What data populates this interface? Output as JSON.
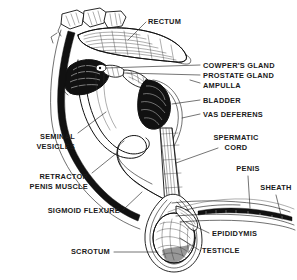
{
  "figure": {
    "background_color": "#ffffff",
    "ink_color": "#111111",
    "label_color": "#1a1a1a",
    "width": 297,
    "height": 280
  },
  "labels": {
    "rectum": "RECTUM",
    "cowpers_gland": "COWPER'S GLAND",
    "prostate_gland": "PROSTATE GLAND",
    "ampulla": "AMPULLA",
    "bladder": "BLADDER",
    "vas_deferens": "VAS DEFERENS",
    "spermatic_cord_line1": "SPERMATIC",
    "spermatic_cord_line2": "CORD",
    "penis": "PENIS",
    "sheath": "SHEATH",
    "seminal_vesicles_line1": "SEMINAL",
    "seminal_vesicles_line2": "VESICLES",
    "retractor_penis_muscle_line1": "RETRACTOR",
    "retractor_penis_muscle_line2": "PENIS MUSCLE",
    "sigmoid_flexure": "SIGMOID FLEXURE",
    "scrotum": "SCROTUM",
    "epididymis": "EPIDIDYMIS",
    "testicle": "TESTICLE"
  },
  "label_list": [
    {
      "id": "rectum",
      "text": "RECTUM",
      "side": "right",
      "x": 148,
      "y": 24
    },
    {
      "id": "cowpers-gland",
      "text": "COWPER'S GLAND",
      "side": "right",
      "x": 203,
      "y": 68
    },
    {
      "id": "prostate-gland",
      "text": "PROSTATE GLAND",
      "side": "right",
      "x": 203,
      "y": 78
    },
    {
      "id": "ampulla",
      "text": "AMPULLA",
      "side": "right",
      "x": 203,
      "y": 88
    },
    {
      "id": "bladder",
      "text": "BLADDER",
      "side": "right",
      "x": 203,
      "y": 103
    },
    {
      "id": "vas-deferens",
      "text": "VAS DEFERENS",
      "side": "right",
      "x": 203,
      "y": 117
    },
    {
      "id": "spermatic-cord",
      "text": "SPERMATIC CORD",
      "side": "right",
      "x": 236,
      "y": 140
    },
    {
      "id": "penis",
      "text": "PENIS",
      "side": "right",
      "x": 246,
      "y": 171
    },
    {
      "id": "sheath",
      "text": "SHEATH",
      "side": "right",
      "x": 271,
      "y": 190
    },
    {
      "id": "seminal-vesicles",
      "text": "SEMINAL VESICLES",
      "side": "left",
      "x": 75,
      "y": 139
    },
    {
      "id": "retractor-penis-muscle",
      "text": "RETRACTOR PENIS MUSCLE",
      "side": "left",
      "x": 88,
      "y": 179
    },
    {
      "id": "sigmoid-flexure",
      "text": "SIGMOID FLEXURE",
      "side": "left",
      "x": 120,
      "y": 213
    },
    {
      "id": "scrotum",
      "text": "SCROTUM",
      "side": "left",
      "x": 110,
      "y": 254
    },
    {
      "id": "epididymis",
      "text": "EPIDIDYMIS",
      "side": "right",
      "x": 212,
      "y": 236
    },
    {
      "id": "testicle",
      "text": "TESTICLE",
      "side": "right",
      "x": 202,
      "y": 253
    }
  ],
  "structures": [
    {
      "id": "rectum-structure",
      "name": "rectum"
    },
    {
      "id": "pelvic-bone-structure",
      "name": "pelvic bone / sacrum"
    },
    {
      "id": "bladder-structure",
      "name": "bladder"
    },
    {
      "id": "seminal-vesicle-structure",
      "name": "seminal vesicle"
    },
    {
      "id": "prostate-structure",
      "name": "prostate gland"
    },
    {
      "id": "cowpers-gland-structure",
      "name": "cowper's gland"
    },
    {
      "id": "ampulla-structure",
      "name": "ampulla"
    },
    {
      "id": "vas-deferens-structure",
      "name": "vas deferens"
    },
    {
      "id": "spermatic-cord-structure",
      "name": "spermatic cord"
    },
    {
      "id": "sigmoid-flexure-structure",
      "name": "sigmoid flexure of penis"
    },
    {
      "id": "retractor-muscle-structure",
      "name": "retractor penis muscle"
    },
    {
      "id": "penis-structure",
      "name": "penis"
    },
    {
      "id": "sheath-structure",
      "name": "sheath / prepuce"
    },
    {
      "id": "scrotum-structure",
      "name": "scrotum"
    },
    {
      "id": "testicle-structure",
      "name": "testicle"
    },
    {
      "id": "epididymis-structure",
      "name": "epididymis"
    }
  ]
}
